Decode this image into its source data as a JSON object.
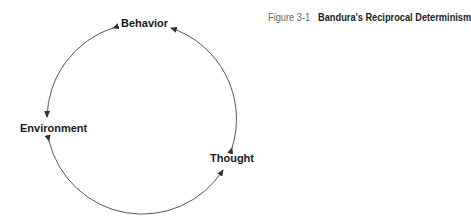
{
  "figure": {
    "number": "Figure 3-1",
    "title": "Bandura's Reciprocal Determinism"
  },
  "nodes": {
    "behavior": "Behavior",
    "environment": "Environment",
    "thought": "Thought"
  },
  "edges": [
    {
      "from": "Behavior",
      "to": "Environment"
    },
    {
      "from": "Environment",
      "to": "Thought"
    },
    {
      "from": "Thought",
      "to": "Behavior"
    }
  ]
}
